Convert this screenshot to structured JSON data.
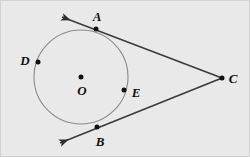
{
  "figure": {
    "kind": "geometry-diagram",
    "width": 250,
    "height": 157,
    "background_color": "#e9e9e9",
    "border_color": "#d2d2d2",
    "stroke_color": "#3b3b3b",
    "circle_stroke_color": "#8a8a8a",
    "point_color": "#101010"
  },
  "circle": {
    "label": "circle-O",
    "center_x": 81,
    "center_y": 77,
    "radius": 47,
    "stroke_width": 1.1
  },
  "points": [
    {
      "id": "A",
      "label": "A",
      "x": 96,
      "y": 29,
      "label_x": 97,
      "label_y": 16,
      "on_circle": true,
      "is_tangent_point": true,
      "show_dot": true
    },
    {
      "id": "B",
      "label": "B",
      "x": 97,
      "y": 127,
      "label_x": 100,
      "label_y": 141,
      "on_circle": true,
      "is_tangent_point": true,
      "show_dot": true
    },
    {
      "id": "C",
      "label": "C",
      "x": 222,
      "y": 78,
      "label_x": 233,
      "label_y": 78,
      "on_circle": false,
      "is_tangent_point": false,
      "show_dot": true
    },
    {
      "id": "D",
      "label": "D",
      "x": 38,
      "y": 62,
      "label_x": 25,
      "label_y": 60,
      "on_circle": true,
      "is_tangent_point": false,
      "show_dot": true
    },
    {
      "id": "E",
      "label": "E",
      "x": 124,
      "y": 90,
      "label_x": 136,
      "label_y": 92,
      "on_circle": true,
      "is_tangent_point": false,
      "show_dot": true
    },
    {
      "id": "O",
      "label": "O",
      "x": 81,
      "y": 77,
      "label_x": 82,
      "label_y": 90,
      "on_circle": false,
      "is_tangent_point": false,
      "show_dot": true
    }
  ],
  "rays": [
    {
      "id": "ray-CA",
      "label": "ray through A from C",
      "from_x": 222,
      "from_y": 78,
      "to_x": 62,
      "to_y": 17,
      "arrow_at_end": true,
      "stroke_width": 1.6
    },
    {
      "id": "ray-CB",
      "label": "ray through B from C",
      "from_x": 222,
      "from_y": 78,
      "to_x": 60,
      "to_y": 143,
      "arrow_at_end": true,
      "stroke_width": 1.6
    }
  ]
}
